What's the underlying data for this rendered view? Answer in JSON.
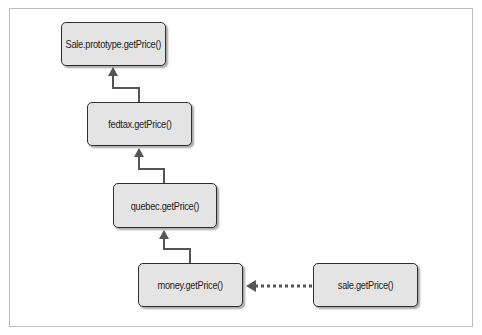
{
  "diagram": {
    "type": "prototype-chain",
    "nodes": [
      {
        "id": "sale_prototype",
        "label": "Sale.prototype.getPrice()"
      },
      {
        "id": "fedtax",
        "label": "fedtax.getPrice()"
      },
      {
        "id": "quebec",
        "label": "quebec.getPrice()"
      },
      {
        "id": "money",
        "label": "money.getPrice()"
      },
      {
        "id": "sale",
        "label": "sale.getPrice()"
      }
    ],
    "edges": [
      {
        "from": "fedtax",
        "to": "sale_prototype",
        "style": "solid"
      },
      {
        "from": "quebec",
        "to": "fedtax",
        "style": "solid"
      },
      {
        "from": "money",
        "to": "quebec",
        "style": "solid"
      },
      {
        "from": "sale",
        "to": "money",
        "style": "dotted"
      }
    ],
    "colors": {
      "node_fill": "#e4e4e4",
      "node_border": "#2e2e2e",
      "arrow": "#555555",
      "frame": "#bdbdbd"
    }
  }
}
